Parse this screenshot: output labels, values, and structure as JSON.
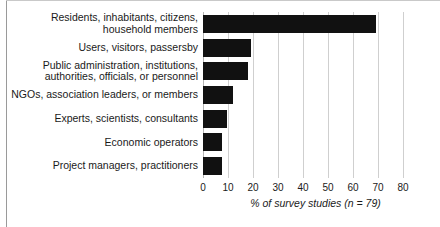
{
  "chart_data": {
    "type": "bar",
    "orientation": "horizontal",
    "title": "",
    "xlabel": "% of survey studies (n = 79)",
    "ylabel": "",
    "xlim": [
      0,
      80
    ],
    "xticks": [
      0,
      10,
      20,
      30,
      40,
      50,
      60,
      70,
      80
    ],
    "grid": "vertical",
    "legend": "none",
    "bar_color": "#111111",
    "categories": [
      "Residents, inhabitants, citizens,\nhousehold members",
      "Users, visitors, passersby",
      "Public administration, institutions,\nauthorities, officials, or personnel",
      "NGOs, association leaders, or members",
      "Experts, scientists, consultants",
      "Economic operators",
      "Project managers, practitioners"
    ],
    "values": [
      69,
      19,
      18,
      12,
      9.5,
      7.5,
      7.5
    ]
  },
  "axis": {
    "title": "% of survey studies (n = 79)"
  }
}
